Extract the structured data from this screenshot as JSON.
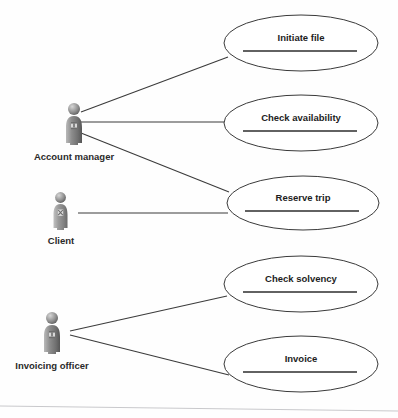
{
  "diagram": {
    "type": "uml-use-case-diagram",
    "title": "",
    "canvas": {
      "width": 398,
      "height": 418,
      "background": "#fefefe"
    },
    "style": {
      "ellipse_stroke": "#3a3a3a",
      "ellipse_fill": "#ffffff",
      "line_color": "#3b3b3b",
      "text_color": "#1d1d1d",
      "actor_body": "#8a8a8a",
      "actor_shadow": "#5e5e5e",
      "page_edge": "#c9c9cc"
    },
    "actors": [
      {
        "id": "account-manager",
        "label": "Account manager",
        "icon": "person-actor-icon",
        "x": 62,
        "y": 103,
        "w": 24,
        "h": 42,
        "label_x": 74,
        "label_y": 160
      },
      {
        "id": "client",
        "label": "Client",
        "icon": "person-actor-icon",
        "x": 50,
        "y": 192,
        "w": 21,
        "h": 38,
        "label_x": 61,
        "label_y": 244
      },
      {
        "id": "invoicing-officer",
        "label": "Invoicing officer",
        "icon": "person-actor-icon",
        "x": 40,
        "y": 312,
        "w": 24,
        "h": 42,
        "label_x": 52,
        "label_y": 369
      }
    ],
    "use_cases": [
      {
        "id": "initiate-file",
        "label": "Initiate file",
        "cx": 301,
        "cy": 43,
        "rx": 77,
        "ry": 28,
        "text_y": 41,
        "divider_y": 51,
        "divider_x1": 243,
        "divider_x2": 357
      },
      {
        "id": "check-availability",
        "label": "Check availability",
        "cx": 301,
        "cy": 123,
        "rx": 77,
        "ry": 28,
        "text_y": 121,
        "divider_y": 131,
        "divider_x1": 243,
        "divider_x2": 357
      },
      {
        "id": "reserve-trip",
        "label": "Reserve trip",
        "cx": 303,
        "cy": 203,
        "rx": 76,
        "ry": 27,
        "text_y": 201,
        "divider_y": 211,
        "divider_x1": 245,
        "divider_x2": 359
      },
      {
        "id": "check-solvency",
        "label": "Check solvency",
        "cx": 301,
        "cy": 284,
        "rx": 77,
        "ry": 28,
        "text_y": 282,
        "divider_y": 292,
        "divider_x1": 243,
        "divider_x2": 357
      },
      {
        "id": "invoice",
        "label": "Invoice",
        "cx": 301,
        "cy": 364,
        "rx": 77,
        "ry": 28,
        "text_y": 362,
        "divider_y": 372,
        "divider_x1": 243,
        "divider_x2": 357
      }
    ],
    "associations": [
      {
        "id": "assoc-am-initiate-file",
        "from": "account-manager",
        "to": "initiate-file",
        "x1": 81,
        "y1": 112,
        "x2": 228,
        "y2": 57
      },
      {
        "id": "assoc-am-check-availability",
        "from": "account-manager",
        "to": "check-availability",
        "x1": 81,
        "y1": 122,
        "x2": 225,
        "y2": 122
      },
      {
        "id": "assoc-am-reserve-trip",
        "from": "account-manager",
        "to": "reserve-trip",
        "x1": 81,
        "y1": 133,
        "x2": 229,
        "y2": 192
      },
      {
        "id": "assoc-client-reserve-trip",
        "from": "client",
        "to": "reserve-trip",
        "x1": 78,
        "y1": 213,
        "x2": 228,
        "y2": 213
      },
      {
        "id": "assoc-io-check-solvency",
        "from": "invoicing-officer",
        "to": "check-solvency",
        "x1": 70,
        "y1": 331,
        "x2": 227,
        "y2": 296
      },
      {
        "id": "assoc-io-invoice",
        "from": "invoicing-officer",
        "to": "invoice",
        "x1": 70,
        "y1": 335,
        "x2": 229,
        "y2": 375
      }
    ],
    "page_edge": {
      "x1": 0,
      "y1": 406,
      "x2": 398,
      "y2": 411
    }
  }
}
